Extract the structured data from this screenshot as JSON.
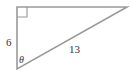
{
  "diagram": {
    "type": "right-triangle",
    "vertical_side_label": "6",
    "hypotenuse_label": "13",
    "angle_label": "θ",
    "right_angle_marker": "top-left",
    "stroke_color": "#999999",
    "text_color": "#333333"
  }
}
